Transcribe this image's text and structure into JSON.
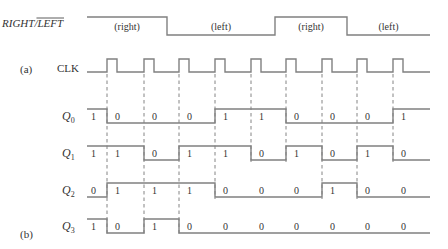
{
  "figure": {
    "control_label": "RIGHT/LEFT",
    "control_label_right": "RIGHT",
    "control_label_left": "LEFT",
    "control_segments": [
      {
        "label": "(right)",
        "level": 1,
        "x0": 87,
        "x1": 167
      },
      {
        "label": "(left)",
        "level": 0,
        "x0": 167,
        "x1": 275
      },
      {
        "label": "(right)",
        "level": 1,
        "x0": 275,
        "x1": 347
      },
      {
        "label": "(left)",
        "level": 0,
        "x0": 347,
        "x1": 430
      }
    ],
    "part_a_label": "(a)",
    "part_b_label": "(b)",
    "clock_label": "CLK",
    "clock_edges_x": [
      107,
      144,
      179,
      215,
      251,
      286,
      322,
      357,
      393
    ],
    "signal_x_start": 87,
    "signal_x_end": 430,
    "signals": [
      {
        "name": "Q",
        "sub": "0",
        "y": 123,
        "values": [
          1,
          0,
          0,
          0,
          1,
          1,
          0,
          0,
          0,
          1
        ]
      },
      {
        "name": "Q",
        "sub": "1",
        "y": 160,
        "values": [
          1,
          1,
          0,
          1,
          1,
          0,
          1,
          0,
          1,
          0
        ]
      },
      {
        "name": "Q",
        "sub": "2",
        "y": 197,
        "values": [
          0,
          1,
          1,
          1,
          0,
          0,
          0,
          1,
          0,
          0
        ]
      },
      {
        "name": "Q",
        "sub": "3",
        "y": 233,
        "values": [
          1,
          0,
          1,
          0,
          0,
          0,
          0,
          0,
          0,
          0
        ]
      }
    ],
    "colors": {
      "wave": "#808080",
      "text": "#333333",
      "dash": "#777777"
    }
  }
}
